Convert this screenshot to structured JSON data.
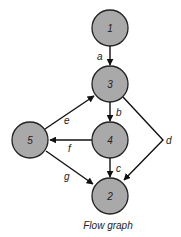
{
  "diagram": {
    "caption": "Flow graph",
    "colors": {
      "node_fill": "#a9a9a9",
      "node_stroke": "#222222",
      "edge": "#111111"
    },
    "nodes": [
      {
        "id": "1",
        "label": "1",
        "cx": 110,
        "cy": 28
      },
      {
        "id": "3",
        "label": "3",
        "cx": 110,
        "cy": 84
      },
      {
        "id": "4",
        "label": "4",
        "cx": 110,
        "cy": 140
      },
      {
        "id": "5",
        "label": "5",
        "cx": 30,
        "cy": 140
      },
      {
        "id": "2",
        "label": "2",
        "cx": 110,
        "cy": 196
      }
    ],
    "edges": [
      {
        "id": "a",
        "label": "a",
        "from": "1",
        "to": "3"
      },
      {
        "id": "b",
        "label": "b",
        "from": "3",
        "to": "4"
      },
      {
        "id": "c",
        "label": "c",
        "from": "4",
        "to": "2"
      },
      {
        "id": "d",
        "label": "d",
        "from": "3",
        "to": "2"
      },
      {
        "id": "e",
        "label": "e",
        "from": "5",
        "to": "3"
      },
      {
        "id": "f",
        "label": "f",
        "from": "4",
        "to": "5"
      },
      {
        "id": "g",
        "label": "g",
        "from": "5",
        "to": "2"
      }
    ]
  }
}
